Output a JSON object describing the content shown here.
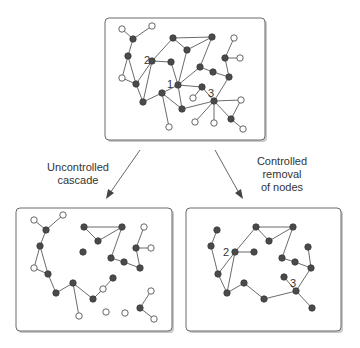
{
  "diagram": {
    "colors": {
      "node_failed_open": "#ffffff",
      "node_active_filled": "#4a4a4a",
      "edge": "#5a5a5a",
      "border": "#6a6a6a"
    },
    "top_panel": {
      "labels": [
        {
          "text": "2",
          "x": 147,
          "y": 64
        },
        {
          "text": "1",
          "x": 168,
          "y": 88
        },
        {
          "text": "3",
          "x": 207,
          "y": 96
        }
      ]
    },
    "arrows": [
      {
        "label_lines": [
          "Uncontrolled",
          "cascade"
        ]
      },
      {
        "label_lines": [
          "Controlled",
          "removal",
          "of nodes"
        ]
      }
    ],
    "bottom_left_panel": {
      "title": "Uncontrolled cascade result",
      "labels": []
    },
    "bottom_right_panel": {
      "title": "Controlled removal result",
      "labels": [
        {
          "text": "2",
          "x": 222,
          "y": 256
        },
        {
          "text": "3",
          "x": 290,
          "y": 286
        }
      ]
    }
  }
}
